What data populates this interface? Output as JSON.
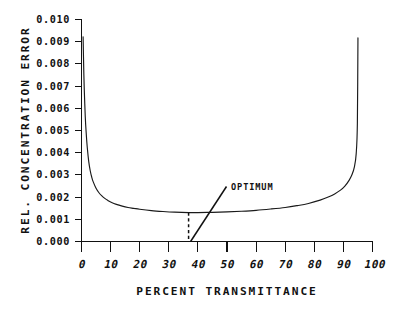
{
  "chart_data": {
    "type": "line",
    "title": "",
    "xlabel": "PERCENT TRANSMITTANCE",
    "ylabel": "REL. CONCENTRATION ERROR",
    "xlim": [
      0,
      100
    ],
    "ylim": [
      0.0,
      0.01
    ],
    "grid": false,
    "legend": null,
    "xticks": [
      0,
      10,
      20,
      30,
      40,
      50,
      60,
      70,
      80,
      90,
      100
    ],
    "xtick_labels": [
      "0",
      "10",
      "20",
      "30",
      "40",
      "50",
      "60",
      "70",
      "80",
      "90",
      "100"
    ],
    "yticks": [
      0.0,
      0.001,
      0.002,
      0.003,
      0.004,
      0.005,
      0.006,
      0.007,
      0.008,
      0.009,
      0.01
    ],
    "ytick_labels": [
      "0.000",
      "0.001",
      "0.002",
      "0.003",
      "0.004",
      "0.005",
      "0.006",
      "0.007",
      "0.008",
      "0.009",
      "0.010"
    ],
    "series": [
      {
        "name": "Relative concentration error",
        "color": "#1a1a1a",
        "x": [
          0.55,
          0.8,
          1.0,
          1.3,
          1.6,
          2.0,
          2.5,
          3.0,
          3.5,
          4.0,
          5.0,
          6.0,
          7.0,
          8.0,
          9.0,
          10.0,
          12.0,
          14.0,
          16.0,
          18.0,
          20.0,
          24.0,
          28.0,
          32.0,
          36.8,
          40.0,
          45.0,
          50.0,
          55.0,
          60.0,
          65.0,
          70.0,
          74.0,
          78.0,
          82.0,
          85.0,
          87.0,
          89.0,
          90.5,
          92.0,
          93.0,
          93.8,
          94.4,
          94.8,
          95.0
        ],
        "y": [
          0.0092,
          0.00755,
          0.00665,
          0.0056,
          0.0049,
          0.0042,
          0.00358,
          0.00318,
          0.0029,
          0.00269,
          0.00239,
          0.00219,
          0.00205,
          0.00194,
          0.00185,
          0.00178,
          0.00167,
          0.00159,
          0.00153,
          0.00149,
          0.00145,
          0.00139,
          0.00135,
          0.00132,
          0.0013,
          0.0013,
          0.00131,
          0.00133,
          0.00136,
          0.0014,
          0.00146,
          0.00153,
          0.00161,
          0.00171,
          0.00186,
          0.00201,
          0.00214,
          0.00231,
          0.00249,
          0.00276,
          0.00302,
          0.00337,
          0.00395,
          0.0053,
          0.00915
        ]
      }
    ],
    "annotations": [
      {
        "text": "OPTIMUM",
        "x": 36.8,
        "y": 0.0013,
        "note": "leader line from label down-left to x-axis at optimum transmittance; dashed drop line from curve minimum to axis"
      }
    ]
  }
}
